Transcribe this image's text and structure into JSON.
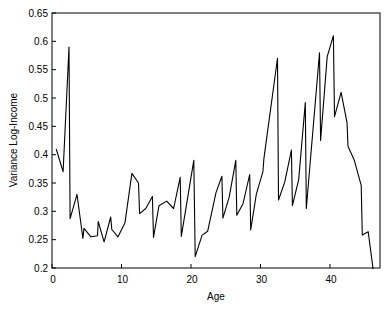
{
  "chart_data": {
    "type": "line",
    "title": "",
    "xlabel": "Age",
    "ylabel": "Variance Log-Income",
    "xlim": [
      0,
      47.2
    ],
    "ylim": [
      0.2,
      0.65
    ],
    "xticks": [
      0,
      10,
      20,
      30,
      40
    ],
    "xtick_labels": [
      "0",
      "10",
      "20",
      "30",
      "40"
    ],
    "yticks": [
      0.2,
      0.25,
      0.3,
      0.35,
      0.4,
      0.45,
      0.5,
      0.55,
      0.6,
      0.65
    ],
    "ytick_labels": [
      "0.2",
      "0.25",
      "0.3",
      "0.35",
      "0.4",
      "0.45",
      "0.5",
      "0.55",
      "0.6",
      "0.65"
    ],
    "grid": false,
    "legend": null,
    "series": [
      {
        "name": "Variance Log-Income",
        "color": "#000000",
        "x": [
          0.6,
          1.6,
          2.45,
          2.6,
          3.6,
          4.45,
          4.6,
          5.6,
          6.55,
          6.65,
          7.5,
          8.45,
          8.6,
          9.5,
          10.5,
          11.5,
          12.45,
          12.6,
          13.5,
          14.45,
          14.6,
          15.4,
          16.5,
          17.5,
          18.45,
          18.6,
          20.4,
          20.6,
          21.6,
          22.4,
          23.6,
          24.45,
          24.6,
          25.5,
          26.45,
          26.6,
          27.5,
          28.45,
          28.6,
          29.4,
          30.35,
          30.5,
          32.45,
          32.6,
          33.5,
          34.45,
          34.6,
          35.5,
          36.45,
          36.6,
          38.5,
          38.65,
          39.6,
          40.5,
          40.65,
          41.6,
          42.45,
          42.6,
          43.5,
          44.5,
          44.65,
          45.5,
          46.2
        ],
        "y": [
          0.41,
          0.37,
          0.59,
          0.287,
          0.33,
          0.252,
          0.27,
          0.255,
          0.257,
          0.282,
          0.246,
          0.29,
          0.268,
          0.255,
          0.28,
          0.367,
          0.35,
          0.296,
          0.305,
          0.326,
          0.254,
          0.31,
          0.318,
          0.305,
          0.36,
          0.256,
          0.39,
          0.22,
          0.258,
          0.265,
          0.333,
          0.362,
          0.288,
          0.325,
          0.39,
          0.293,
          0.314,
          0.365,
          0.267,
          0.33,
          0.37,
          0.393,
          0.57,
          0.32,
          0.352,
          0.408,
          0.31,
          0.356,
          0.492,
          0.305,
          0.58,
          0.425,
          0.573,
          0.61,
          0.467,
          0.51,
          0.457,
          0.415,
          0.39,
          0.346,
          0.258,
          0.264,
          0.198
        ]
      }
    ]
  },
  "labels": {
    "xlabel": "Age",
    "ylabel": "Variance Log-Income"
  }
}
